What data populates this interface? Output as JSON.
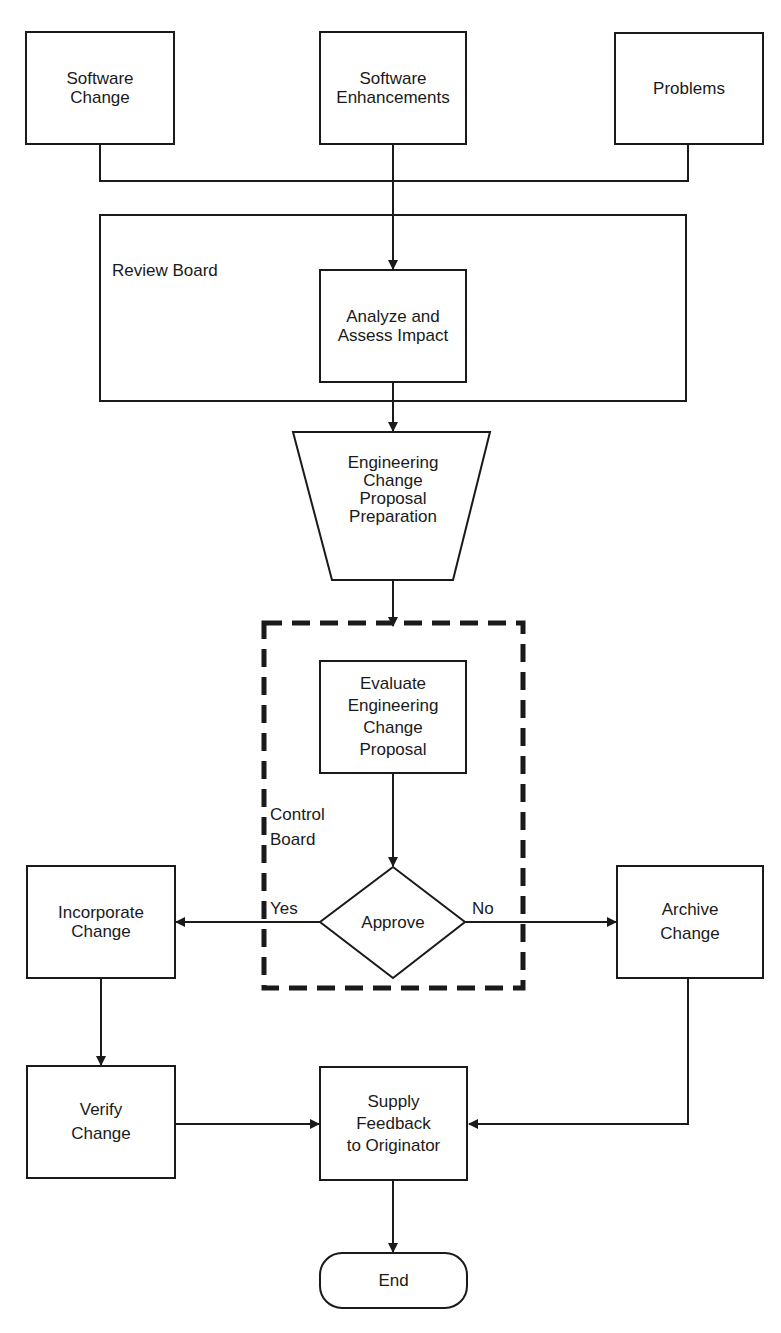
{
  "diagram": {
    "nodes": {
      "software_change": {
        "label": "Software\nChange",
        "shape": "rectangle"
      },
      "software_enhancements": {
        "label": "Software\nEnhancements",
        "shape": "rectangle"
      },
      "problems": {
        "label": "Problems",
        "shape": "rectangle"
      },
      "analyze": {
        "label": "Analyze and\nAssess Impact",
        "shape": "rectangle"
      },
      "ecp_prep": {
        "label": "Engineering\nChange\nProposal\nPreparation",
        "shape": "trapezoid"
      },
      "evaluate": {
        "label": "Evaluate\nEngineering\nChange\nProposal",
        "shape": "rectangle"
      },
      "approve": {
        "label": "Approve",
        "shape": "diamond"
      },
      "incorporate": {
        "label": "Incorporate\nChange",
        "shape": "rectangle"
      },
      "archive": {
        "label": "Archive\nChange",
        "shape": "rectangle"
      },
      "verify": {
        "label": "Verify\nChange",
        "shape": "rectangle"
      },
      "feedback": {
        "label": "Supply\nFeedback\nto Originator",
        "shape": "rectangle"
      },
      "end": {
        "label": "End",
        "shape": "terminator"
      }
    },
    "groups": {
      "review_board": {
        "label": "Review Board",
        "style": "solid"
      },
      "control_board": {
        "label": "Control\nBoard",
        "style": "dashed"
      }
    },
    "edge_labels": {
      "yes": "Yes",
      "no": "No"
    },
    "edges": [
      {
        "from": "software_change",
        "to": "analyze"
      },
      {
        "from": "software_enhancements",
        "to": "analyze"
      },
      {
        "from": "problems",
        "to": "analyze"
      },
      {
        "from": "analyze",
        "to": "ecp_prep"
      },
      {
        "from": "ecp_prep",
        "to": "evaluate"
      },
      {
        "from": "evaluate",
        "to": "approve"
      },
      {
        "from": "approve",
        "to": "incorporate",
        "label": "Yes"
      },
      {
        "from": "approve",
        "to": "archive",
        "label": "No"
      },
      {
        "from": "incorporate",
        "to": "verify"
      },
      {
        "from": "verify",
        "to": "feedback"
      },
      {
        "from": "archive",
        "to": "feedback"
      },
      {
        "from": "feedback",
        "to": "end"
      }
    ],
    "colors": {
      "stroke": "#1a1a1a",
      "background": "#ffffff"
    }
  }
}
